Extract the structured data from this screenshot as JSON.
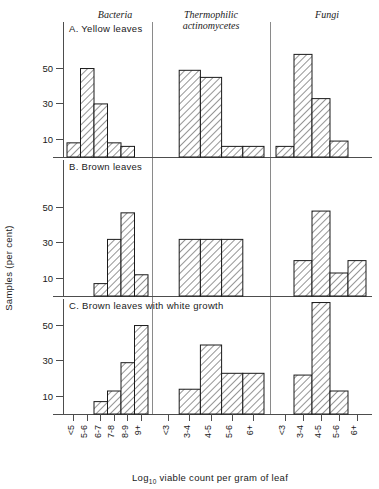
{
  "figure": {
    "y_axis_label": "Samples (per cent)",
    "x_axis_label_main": "Log",
    "x_axis_label_sub": "10",
    "x_axis_label_rest": " viable count per gram of leaf",
    "column_headers": [
      {
        "line1": "Bacteria",
        "line2": ""
      },
      {
        "line1": "Thermophilic",
        "line2": "actinomycetes"
      },
      {
        "line1": "Fungi",
        "line2": ""
      }
    ],
    "panel_titles": [
      "A. Yellow leaves",
      "B. Brown leaves",
      "C. Brown leaves with white growth"
    ],
    "y_ticks": [
      10,
      30,
      50
    ],
    "colors": {
      "ink": "#1a1a1a",
      "axis": "#4d4d4d",
      "separator": "#8a8a8a",
      "background": "#ffffff"
    }
  },
  "chart_data": {
    "type": "bar",
    "xlabel": "Log10 viable count per gram of leaf",
    "ylabel": "Samples (per cent)",
    "ylim": [
      0,
      65
    ],
    "yticks": [
      10,
      30,
      50
    ],
    "grid": false,
    "legend": "none",
    "panels": [
      {
        "id": "A",
        "title": "A. Yellow leaves",
        "groups": [
          {
            "name": "Bacteria",
            "categories": [
              "<5",
              "5-6",
              "6-7",
              "7-8",
              "8-9",
              "9+"
            ],
            "values": [
              8,
              50,
              30,
              8,
              6,
              0
            ]
          },
          {
            "name": "Thermophilic actinomycetes",
            "categories": [
              "<3",
              "3-4",
              "4-5",
              "5-6",
              "6+"
            ],
            "values": [
              0,
              49,
              45,
              6,
              6
            ]
          },
          {
            "name": "Fungi",
            "categories": [
              "<3",
              "3-4",
              "4-5",
              "5-6",
              "6+"
            ],
            "values": [
              6,
              58,
              33,
              9,
              0
            ]
          }
        ]
      },
      {
        "id": "B",
        "title": "B. Brown leaves",
        "groups": [
          {
            "name": "Bacteria",
            "categories": [
              "<5",
              "5-6",
              "6-7",
              "7-8",
              "8-9",
              "9+"
            ],
            "values": [
              0,
              0,
              7,
              32,
              47,
              12
            ]
          },
          {
            "name": "Thermophilic actinomycetes",
            "categories": [
              "<3",
              "3-4",
              "4-5",
              "5-6",
              "6+"
            ],
            "values": [
              0,
              32,
              32,
              32,
              0
            ]
          },
          {
            "name": "Fungi",
            "categories": [
              "<3",
              "3-4",
              "4-5",
              "5-6",
              "6+"
            ],
            "values": [
              0,
              20,
              48,
              13,
              20
            ]
          }
        ]
      },
      {
        "id": "C",
        "title": "C. Brown leaves with white growth",
        "groups": [
          {
            "name": "Bacteria",
            "categories": [
              "<5",
              "5-6",
              "6-7",
              "7-8",
              "8-9",
              "9+"
            ],
            "values": [
              0,
              0,
              7,
              13,
              29,
              50
            ]
          },
          {
            "name": "Thermophilic actinomycetes",
            "categories": [
              "<3",
              "3-4",
              "4-5",
              "5-6",
              "6+"
            ],
            "values": [
              0,
              14,
              39,
              23,
              23
            ]
          },
          {
            "name": "Fungi",
            "categories": [
              "<3",
              "3-4",
              "4-5",
              "5-6",
              "6+"
            ],
            "values": [
              0,
              22,
              63,
              13,
              0
            ]
          }
        ]
      }
    ]
  }
}
